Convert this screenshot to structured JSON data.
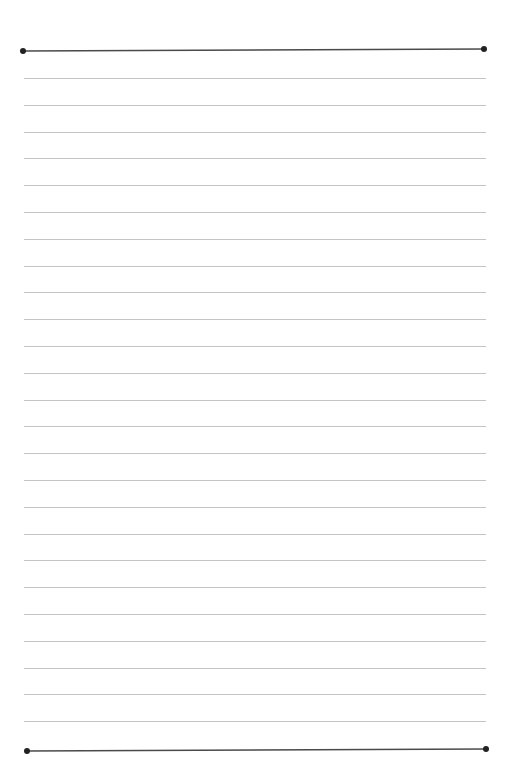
{
  "document": {
    "type": "lined-notepaper",
    "width": 514,
    "height": 781,
    "text_content": ""
  },
  "border_lines": {
    "color": "#4a4a4a",
    "thickness": 1.6,
    "dot_radius": 3,
    "top": {
      "x1": 23,
      "y1": 51,
      "x2": 484,
      "y2": 49
    },
    "bottom": {
      "x1": 27,
      "y1": 751,
      "x2": 486,
      "y2": 749
    }
  },
  "ruled_lines": {
    "color": "#c4c4c4",
    "thickness": 1,
    "x_start": 24,
    "x_end": 486,
    "count": 25,
    "first_y": 78,
    "spacing": 26.8
  }
}
